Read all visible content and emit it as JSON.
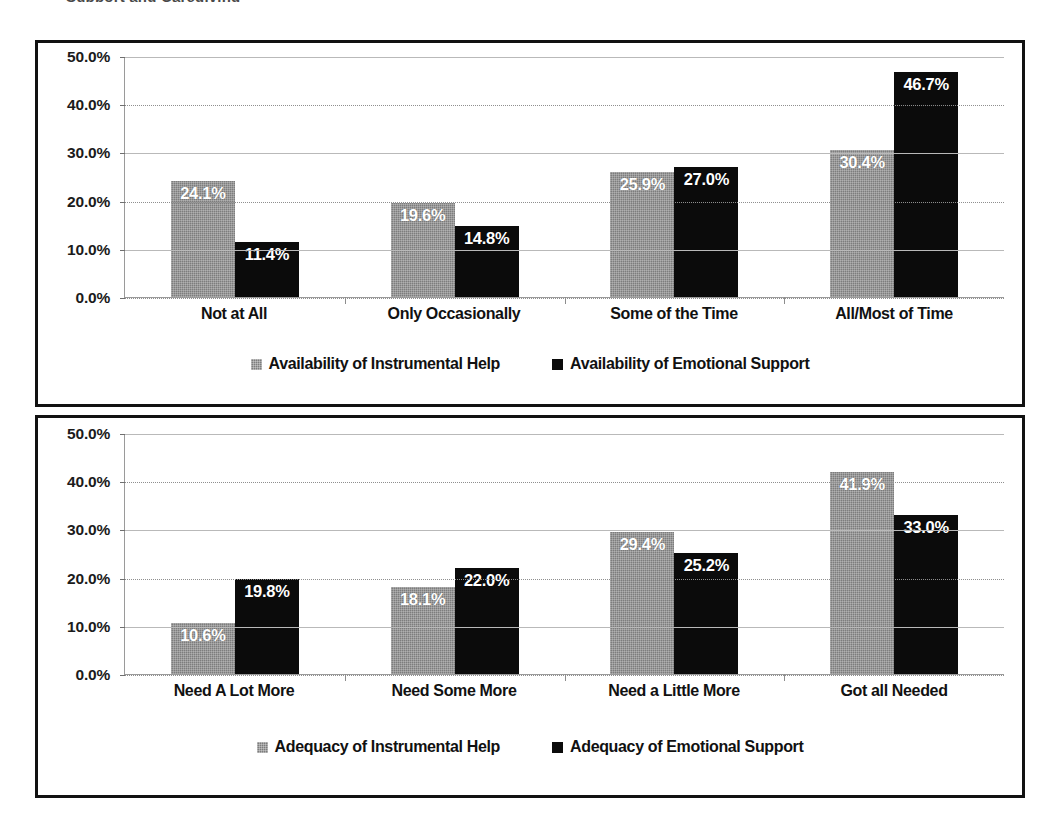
{
  "page": {
    "background": "#ffffff",
    "cut_off_heading_fragment": "Support and Caregiving"
  },
  "palette": {
    "series_gray": "#7d7d7d",
    "series_black": "#0b0b0b",
    "border": "#111111",
    "gridline": "#b9b9b9",
    "data_label_color": "#ffffff"
  },
  "chart_data": [
    {
      "id": "availability",
      "type": "bar",
      "title": "",
      "xlabel": "",
      "ylabel": "",
      "ylim": [
        0,
        50
      ],
      "ytick_labels": [
        "0.0%",
        "10.0%",
        "20.0%",
        "30.0%",
        "40.0%",
        "50.0%"
      ],
      "ytick_values": [
        0,
        10,
        20,
        30,
        40,
        50
      ],
      "grid": true,
      "legend_position": "bottom",
      "categories": [
        "Not at All",
        "Only Occasionally",
        "Some of the Time",
        "All/Most of Time"
      ],
      "series": [
        {
          "name": "Availability of Instrumental Help",
          "color": "#7d7d7d",
          "values": [
            24.1,
            19.6,
            25.9,
            30.4
          ],
          "labels": [
            "24.1%",
            "19.6%",
            "25.9%",
            "30.4%"
          ]
        },
        {
          "name": "Availability of Emotional Support",
          "color": "#0b0b0b",
          "values": [
            11.4,
            14.8,
            27.0,
            46.7
          ],
          "labels": [
            "11.4%",
            "14.8%",
            "27.0%",
            "46.7%"
          ]
        }
      ]
    },
    {
      "id": "adequacy",
      "type": "bar",
      "title": "",
      "xlabel": "",
      "ylabel": "",
      "ylim": [
        0,
        50
      ],
      "ytick_labels": [
        "0.0%",
        "10.0%",
        "20.0%",
        "30.0%",
        "40.0%",
        "50.0%"
      ],
      "ytick_values": [
        0,
        10,
        20,
        30,
        40,
        50
      ],
      "grid": true,
      "legend_position": "bottom",
      "categories": [
        "Need A Lot More",
        "Need Some More",
        "Need a Little More",
        "Got all Needed"
      ],
      "series": [
        {
          "name": "Adequacy of Instrumental Help",
          "color": "#7d7d7d",
          "values": [
            10.6,
            18.1,
            29.4,
            41.9
          ],
          "labels": [
            "10.6%",
            "18.1%",
            "29.4%",
            "41.9%"
          ]
        },
        {
          "name": "Adequacy of Emotional Support",
          "color": "#0b0b0b",
          "values": [
            19.8,
            22.0,
            25.2,
            33.0
          ],
          "labels": [
            "19.8%",
            "22.0%",
            "25.2%",
            "33.0%"
          ]
        }
      ]
    }
  ]
}
